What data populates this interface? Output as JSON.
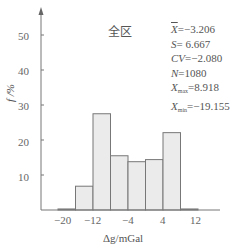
{
  "chart_data": {
    "type": "bar",
    "title": "全区",
    "xlabel": "Δg/mGal",
    "ylabel": "f /%",
    "bin_edges": [
      -20,
      -16,
      -12,
      -8,
      -4,
      0,
      4,
      8,
      12
    ],
    "categories": [
      "-20~-16",
      "-16~-12",
      "-12~-8",
      "-8~-4",
      "-4~0",
      "0~4",
      "4~8",
      "8~12"
    ],
    "values": [
      0.3,
      6.8,
      27.5,
      15.5,
      13.8,
      14.4,
      22.1,
      0.3
    ],
    "xlim": [
      -22,
      14
    ],
    "ylim": [
      0,
      55
    ],
    "xticks": [
      -20,
      -12,
      -4,
      4,
      12
    ],
    "yticks": [
      10,
      20,
      30,
      40,
      50
    ],
    "grid": false,
    "bar_fill": "#ebebeb",
    "bar_edge": "#777777",
    "annotations": [
      "X̄=−3.206",
      "S= 6.667",
      "CV=−2.080",
      "N=1080",
      "Xmax=8.918",
      "Xmin=−19.155"
    ]
  },
  "stats": {
    "mean_sym": "X",
    "mean_val": "=−3.206",
    "s_sym": "S",
    "s_val": "= 6.667",
    "cv_sym": "CV",
    "cv_val": "=−2.080",
    "n_sym": "N",
    "n_val": "=1080",
    "xmax_sym": "X",
    "xmax_sub": "max",
    "xmax_val": "=8.918",
    "xmin_sym": "X",
    "xmin_sub": "min",
    "xmin_val": "=−19.155"
  },
  "labels": {
    "title": "全区",
    "xlabel": "Δg/mGal",
    "ylabel": "f /%",
    "yticks": [
      "10",
      "20",
      "30",
      "40",
      "50"
    ],
    "xticks": [
      "−20",
      "−12",
      "−4",
      "4",
      "12"
    ]
  }
}
